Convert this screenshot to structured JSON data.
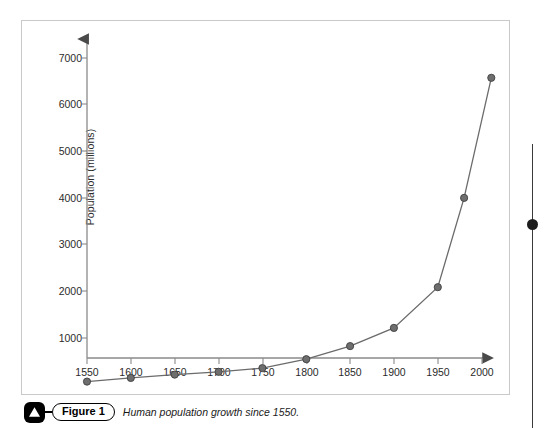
{
  "caption": {
    "figure_label": "Figure 1",
    "text": "Human population growth since 1550.",
    "icon": "triangle-icon"
  },
  "axes": {
    "y_title": "Population (millions)",
    "y_ticks": [
      "1000",
      "2000",
      "3000",
      "4000",
      "5000",
      "6000",
      "7000"
    ],
    "x_ticks": [
      "1550",
      "1600",
      "1650",
      "1700",
      "1750",
      "1800",
      "1850",
      "1900",
      "1950",
      "2000"
    ]
  },
  "style": {
    "line_color": "#6b6b6b",
    "marker_color": "#6e6e6e",
    "marker_edge": "#3f3f3f",
    "axis_color": "#8a8a8a",
    "frame_color": "#c9c9c9"
  },
  "chart_data": {
    "type": "line",
    "title": "Human population growth since 1550",
    "xlabel": "",
    "ylabel": "Population (millions)",
    "xlim": [
      1530,
      2035
    ],
    "ylim": [
      0,
      7600
    ],
    "grid": false,
    "legend": "none",
    "x": [
      1550,
      1600,
      1650,
      1700,
      1750,
      1800,
      1850,
      1900,
      1950,
      1980,
      2011
    ],
    "series": [
      {
        "name": "World population",
        "values": [
          500,
          580,
          650,
          710,
          790,
          980,
          1260,
          1650,
          2520,
          4430,
          7000
        ]
      }
    ]
  }
}
